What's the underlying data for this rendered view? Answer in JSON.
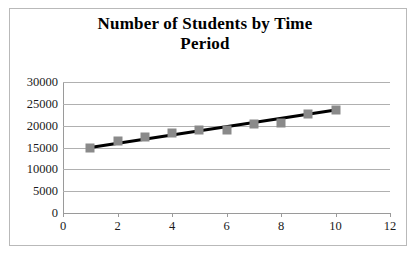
{
  "chart_data": {
    "type": "scatter",
    "title": "Number of Students by Time Period",
    "title_line1": "Number of Students by Time",
    "title_line2": "Period",
    "xlabel": "",
    "ylabel": "",
    "x": [
      1,
      2,
      3,
      4,
      5,
      6,
      7,
      8,
      9,
      10
    ],
    "values": [
      15000,
      16500,
      17500,
      18400,
      19000,
      19000,
      20300,
      20500,
      22700,
      23700
    ],
    "series": [
      {
        "name": "Number of Students",
        "values": [
          15000,
          16500,
          17500,
          18400,
          19000,
          19000,
          20300,
          20500,
          22700,
          23700
        ]
      }
    ],
    "trendline": {
      "type": "linear",
      "x_start": 1,
      "y_start": 15000,
      "x_end": 10,
      "y_end": 23600
    },
    "xlim": [
      0,
      12
    ],
    "ylim": [
      0,
      30000
    ],
    "xticks": [
      0,
      2,
      4,
      6,
      8,
      10,
      12
    ],
    "xtick_labels": [
      "0",
      "2",
      "4",
      "6",
      "8",
      "10",
      "12"
    ],
    "yticks": [
      0,
      5000,
      10000,
      15000,
      20000,
      25000,
      30000
    ],
    "ytick_labels": [
      "0",
      "5000",
      "10000",
      "15000",
      "20000",
      "25000",
      "30000"
    ],
    "grid": "horizontal",
    "legend": "none",
    "colors": {
      "marker": "#8a8a8a",
      "trendline": "#000000",
      "gridline": "#b0b0b0",
      "axis": "#9a9a9a",
      "text": "#1a1a1a",
      "background": "#ffffff",
      "border": "#b9b9b9"
    }
  }
}
